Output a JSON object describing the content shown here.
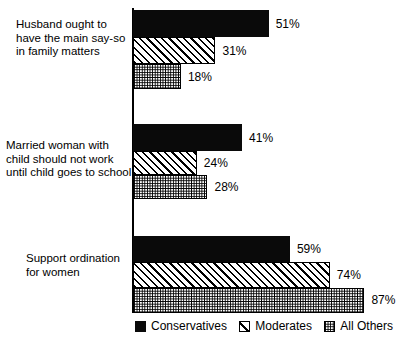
{
  "chart_data": {
    "type": "bar",
    "orientation": "horizontal",
    "title": "",
    "subtitle": "",
    "xlabel": "",
    "ylabel": "",
    "xlim": [
      0,
      100
    ],
    "grid": false,
    "legend_position": "bottom",
    "value_suffix": "%",
    "categories": [
      "Husband ought to\nhave the main say-so\nin family matters",
      "Married woman with\nchild should not work\nuntil child goes to school",
      "Support ordination\nfor women"
    ],
    "series": [
      {
        "name": "Conservatives",
        "pattern": "solid",
        "values": [
          51,
          41,
          59
        ]
      },
      {
        "name": "Moderates",
        "pattern": "hatch",
        "values": [
          31,
          24,
          74
        ]
      },
      {
        "name": "All Others",
        "pattern": "dots",
        "values": [
          18,
          28,
          87
        ]
      }
    ],
    "data_labels": [
      [
        "51%",
        "31%",
        "18%"
      ],
      [
        "41%",
        "24%",
        "28%"
      ],
      [
        "59%",
        "74%",
        "87%"
      ]
    ]
  },
  "legend": {
    "items": [
      {
        "label": "Conservatives",
        "pattern": "solid"
      },
      {
        "label": "Moderates",
        "pattern": "hatch"
      },
      {
        "label": "All Others",
        "pattern": "dots"
      }
    ]
  },
  "colors": {
    "conservatives": "#0a0a0a",
    "moderates_line": "#000000",
    "all_others_line": "#000000",
    "background": "#ffffff",
    "axis": "#000000"
  }
}
